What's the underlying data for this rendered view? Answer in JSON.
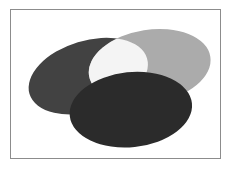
{
  "figure": {
    "background_color": "#FFFFFF",
    "frame": {
      "border_color": "#8C8C8C",
      "border_width_px": 1,
      "x": 10,
      "y": 9,
      "width": 211,
      "height": 150
    },
    "canvas": {
      "width": 232,
      "height": 170
    }
  },
  "chart_data": {
    "type": "diagram",
    "subtype": "venn-like-ellipse-overlap",
    "shape_count": 3,
    "grid": false,
    "legend": "none",
    "shapes": [
      {
        "name": "left-ellipse",
        "label": "Left dark gray ellipse",
        "fill": "#424242",
        "cx": 88,
        "cy": 76,
        "rx": 62,
        "ry": 36,
        "rotation_deg": -17,
        "z_order": 1,
        "blend": "normal"
      },
      {
        "name": "right-ellipse",
        "label": "Upper right light gray ellipse",
        "fill": "#ABABAB",
        "cx": 150,
        "cy": 66,
        "rx": 62,
        "ry": 37,
        "rotation_deg": -9,
        "z_order": 2,
        "blend": "lighten"
      },
      {
        "name": "bottom-ellipse",
        "label": "Bottom darkest ellipse",
        "fill": "#2B2B2B",
        "cx": 131,
        "cy": 110,
        "rx": 62,
        "ry": 38,
        "rotation_deg": -6,
        "z_order": 3,
        "blend": "normal"
      }
    ],
    "intersections": [
      {
        "name": "left-right-overlap",
        "label": "Lens where left dark and right light ellipses overlap",
        "fill": "#F4F4F4"
      }
    ],
    "palette": {
      "dark_gray": "#424242",
      "light_gray": "#ABABAB",
      "darkest_gray": "#2B2B2B",
      "overlap_white": "#F4F4F4",
      "frame_gray": "#8C8C8C",
      "background": "#FFFFFF"
    }
  }
}
